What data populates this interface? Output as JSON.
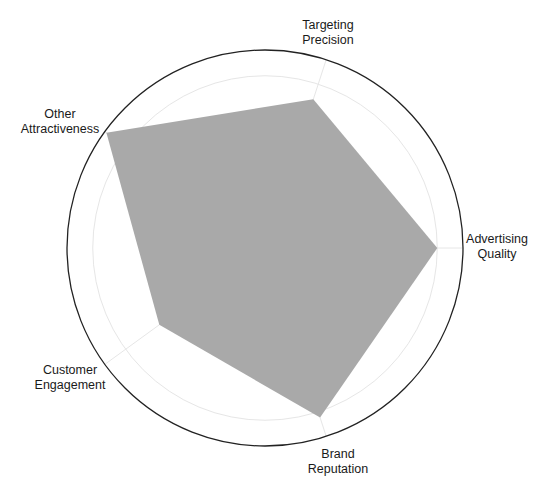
{
  "chart_data": {
    "type": "radar",
    "title": "",
    "axes": [
      "Targeting Precision",
      "Advertising Quality",
      "Brand Reputation",
      "Customer Engagement",
      "Other Attractiveness"
    ],
    "label_lines": [
      [
        "Targeting",
        "Precision"
      ],
      [
        "Advertising",
        "Quality"
      ],
      [
        "Brand",
        "Reputation"
      ],
      [
        "Customer",
        "Engagement"
      ],
      [
        "Other",
        "Attractiveness"
      ]
    ],
    "series": [
      {
        "name": "",
        "values": [
          0.79,
          0.87,
          0.9,
          0.66,
          0.99
        ],
        "fill": "#a9a9a9"
      }
    ],
    "rlim": [
      0,
      1
    ],
    "gridlines": [
      0.87
    ],
    "grid": true,
    "legend": false,
    "outer_circle_color": "#222222",
    "gridline_color": "#e6e6e6"
  },
  "layout": {
    "center": [
      265,
      248
    ],
    "radius": 198,
    "axis_angles_deg": [
      72,
      0,
      -72,
      -144,
      144
    ],
    "label_positions": [
      [
        328,
        25
      ],
      [
        497,
        239
      ],
      [
        338,
        454
      ],
      [
        70,
        370
      ],
      [
        60,
        114
      ]
    ]
  }
}
